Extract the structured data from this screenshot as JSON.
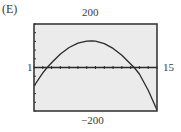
{
  "panel_label": "(E)",
  "window": {
    "xmin_label": "1",
    "xmax_label": "15",
    "ymax_label": "200",
    "ymin_label": "−200"
  },
  "colors": {
    "screen_bg": "#ebebeb",
    "frame": "#3a3a3a",
    "curve": "#2a2a2a",
    "axis": "#2a2a2a"
  },
  "chart_data": {
    "type": "line",
    "title": "(E)",
    "xlabel": "",
    "ylabel": "",
    "xlim": [
      1,
      15
    ],
    "ylim": [
      -200,
      200
    ],
    "grid": false,
    "legend": null,
    "tick_labels": {
      "x": [
        "1",
        "15"
      ],
      "y": [
        "-200",
        "200"
      ]
    },
    "x_ticks_every": 1,
    "y_ticks_every": 40,
    "series": [
      {
        "name": "parabola",
        "x": [
          1,
          2,
          2.5,
          3,
          4,
          5,
          6,
          7,
          7.6,
          8,
          9,
          10,
          11,
          12,
          12.4,
          13,
          14,
          15
        ],
        "values": [
          -85,
          -25,
          0,
          22,
          62,
          92,
          112,
          121,
          122,
          121,
          110,
          88,
          56,
          16,
          0,
          -30,
          -105,
          -195
        ]
      }
    ]
  }
}
